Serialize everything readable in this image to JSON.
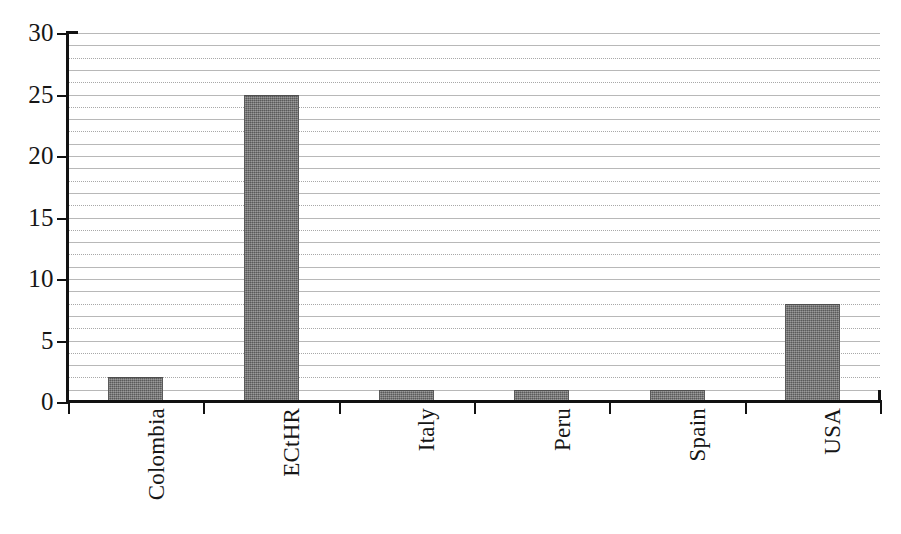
{
  "chart_data": {
    "type": "bar",
    "title": "",
    "subtitle": "",
    "xlabel": "",
    "ylabel": "",
    "categories": [
      "Colombia",
      "ECtHR",
      "Italy",
      "Peru",
      "Spain",
      "USA"
    ],
    "values": [
      2,
      25,
      1,
      1,
      1,
      8
    ],
    "ylim": [
      0,
      30
    ],
    "y_tick_labels": [
      "0",
      "5",
      "10",
      "15",
      "20",
      "25",
      "30"
    ],
    "y_tick_values": [
      0,
      5,
      10,
      15,
      20,
      25,
      30
    ],
    "y_tick_step": 5,
    "gridline_step": 1,
    "gridlines": true,
    "grid_orientation": "horizontal",
    "legend": null,
    "legend_position": "none",
    "annotations": [],
    "bar_color": "#6e6e6e",
    "gridline_color": "#8d8d8d",
    "axis_color": "#121212",
    "background_color": "#ffffff",
    "x_label_rotation": -90,
    "series": [
      {
        "name": "count",
        "values": [
          2,
          25,
          1,
          1,
          1,
          8
        ]
      }
    ]
  },
  "figure": {
    "alt_text": "Bar chart of counts by jurisdiction: Colombia 2, ECtHR 25, Italy 1, Peru 1, Spain 1, USA 8"
  }
}
